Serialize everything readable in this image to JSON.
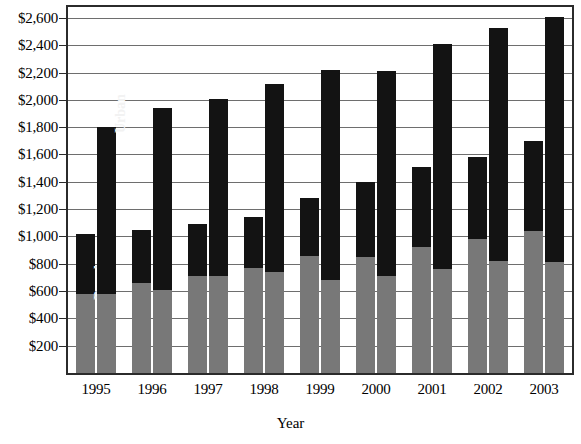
{
  "chart_data": {
    "type": "bar",
    "title": "",
    "subtitle": "",
    "xlabel": "Year",
    "ylabel": "",
    "grid": true,
    "legend_position": "in-bar",
    "stacked": true,
    "grouped": true,
    "categories": [
      "1995",
      "1996",
      "1997",
      "1998",
      "1999",
      "2000",
      "2001",
      "2002",
      "2003"
    ],
    "ylim": [
      0,
      2680
    ],
    "ytick_values": [
      200,
      400,
      600,
      800,
      1000,
      1200,
      1400,
      1600,
      1800,
      2000,
      2200,
      2400,
      2600
    ],
    "ytick_labels": [
      "$200",
      "$400",
      "$600",
      "$800",
      "$1,000",
      "$1,200",
      "$1,400",
      "$1,600",
      "$1,800",
      "$2,000",
      "$2,200",
      "$2,400",
      "$2,600"
    ],
    "series": [
      {
        "name": "Rural",
        "group": 1,
        "segment": "lower",
        "color": "#787878",
        "values": [
          580,
          660,
          710,
          770,
          860,
          850,
          920,
          980,
          1040
        ]
      },
      {
        "name": "Rural upper",
        "group": 1,
        "segment": "upper",
        "color": "#131313",
        "values": [
          440,
          390,
          380,
          370,
          420,
          550,
          590,
          600,
          660
        ]
      },
      {
        "name": "Urban lower",
        "group": 2,
        "segment": "lower",
        "color": "#787878",
        "values": [
          580,
          610,
          710,
          740,
          680,
          710,
          760,
          820,
          810
        ]
      },
      {
        "name": "Urban",
        "group": 2,
        "segment": "upper",
        "color": "#131313",
        "values": [
          1220,
          1330,
          1300,
          1380,
          1540,
          1500,
          1650,
          1710,
          1800
        ]
      }
    ],
    "group_totals": {
      "group1": [
        1020,
        1050,
        1090,
        1140,
        1280,
        1400,
        1510,
        1580,
        1700
      ],
      "group2": [
        1800,
        1940,
        2010,
        2120,
        2220,
        2210,
        2410,
        2530,
        2610
      ]
    },
    "inbar_labels": [
      {
        "text": "Rural",
        "category": "1995",
        "group": 1,
        "segment": "lower"
      },
      {
        "text": "Urban",
        "category": "1995",
        "group": 2,
        "segment": "upper"
      }
    ],
    "colors": {
      "lower_segment": "#787878",
      "upper_segment": "#131313",
      "gridline": "#6e6e6e",
      "axis": "#2b2b2b",
      "background": "#ffffff",
      "inbar_label": "#f2f2f2"
    }
  }
}
